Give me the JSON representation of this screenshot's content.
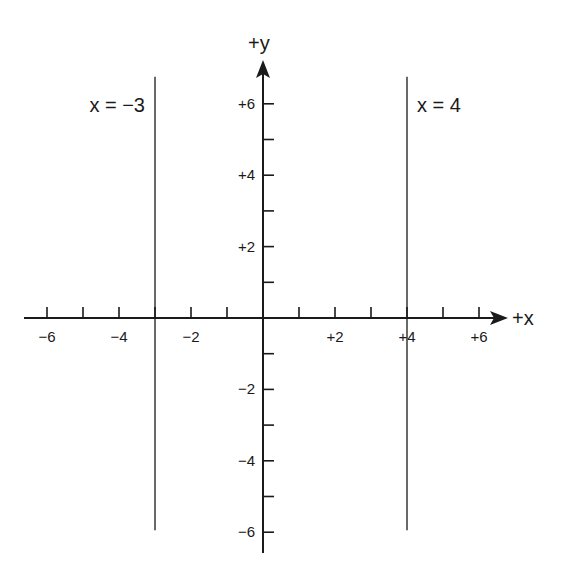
{
  "chart_data": {
    "type": "line",
    "title": "",
    "xlabel": "+x",
    "ylabel": "+y",
    "xlim": [
      -7,
      7
    ],
    "ylim": [
      -7,
      7
    ],
    "grid": false,
    "x_ticks": [
      -6,
      -5,
      -4,
      -3,
      -2,
      -1,
      1,
      2,
      3,
      4,
      5,
      6
    ],
    "x_tick_labels": [
      {
        "value": -6,
        "label": "−6"
      },
      {
        "value": -4,
        "label": "−4"
      },
      {
        "value": -2,
        "label": "−2"
      },
      {
        "value": 2,
        "label": "+2"
      },
      {
        "value": 4,
        "label": "+4"
      },
      {
        "value": 6,
        "label": "+6"
      }
    ],
    "y_ticks": [
      -6,
      -5,
      -4,
      -3,
      -2,
      -1,
      1,
      2,
      3,
      4,
      5,
      6
    ],
    "y_tick_labels": [
      {
        "value": 6,
        "label": "+6"
      },
      {
        "value": 4,
        "label": "+4"
      },
      {
        "value": 2,
        "label": "+2"
      },
      {
        "value": -2,
        "label": "−2"
      },
      {
        "value": -4,
        "label": "−4"
      },
      {
        "value": -6,
        "label": "−6"
      }
    ],
    "series": [
      {
        "name": "x = −3",
        "label": "x = −3",
        "x": [
          -3,
          -3
        ],
        "y": [
          -6,
          6
        ]
      },
      {
        "name": "x = 4",
        "label": "x = 4",
        "x": [
          4,
          4
        ],
        "y": [
          -6,
          6
        ]
      }
    ]
  },
  "colors": {
    "ink": "#1a1a1a",
    "background": "#ffffff"
  }
}
